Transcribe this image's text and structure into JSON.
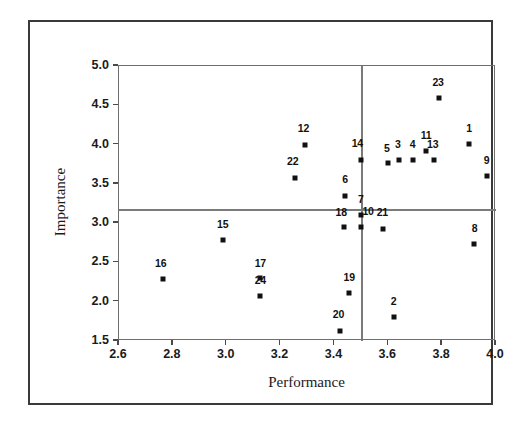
{
  "chart_data": {
    "type": "scatter",
    "title": "",
    "xlabel": "Performance",
    "ylabel": "Importance",
    "xlim": [
      2.6,
      4.0
    ],
    "ylim": [
      1.5,
      5.0
    ],
    "xticks": [
      "2.6",
      "2.8",
      "3.0",
      "3.2",
      "3.4",
      "3.6",
      "3.8",
      "4.0"
    ],
    "xtick_values": [
      2.6,
      2.8,
      3.0,
      3.2,
      3.4,
      3.6,
      3.8,
      4.0
    ],
    "yticks": [
      "1.5",
      "2.0",
      "2.5",
      "3.0",
      "3.5",
      "4.0",
      "4.5",
      "5.0"
    ],
    "ytick_values": [
      1.5,
      2.0,
      2.5,
      3.0,
      3.5,
      4.0,
      4.5,
      5.0
    ],
    "grid": false,
    "legend": "none",
    "reference_lines": {
      "vertical_x": 3.5,
      "horizontal_y": 3.18
    },
    "marker": "square",
    "marker_color": "#111111",
    "points": [
      {
        "label": "1",
        "x": 3.9,
        "y": 4.01,
        "lx": 3.9,
        "ly": 4.17
      },
      {
        "label": "2",
        "x": 3.62,
        "y": 1.81,
        "lx": 3.62,
        "ly": 1.97
      },
      {
        "label": "3",
        "x": 3.64,
        "y": 3.8,
        "lx": 3.635,
        "ly": 3.97
      },
      {
        "label": "4",
        "x": 3.69,
        "y": 3.8,
        "lx": 3.69,
        "ly": 3.97
      },
      {
        "label": "5",
        "x": 3.6,
        "y": 3.76,
        "lx": 3.595,
        "ly": 3.92
      },
      {
        "label": "6",
        "x": 3.44,
        "y": 3.35,
        "lx": 3.44,
        "ly": 3.52
      },
      {
        "label": "7",
        "x": 3.5,
        "y": 3.1,
        "lx": 3.498,
        "ly": 3.27
      },
      {
        "label": "8",
        "x": 3.92,
        "y": 2.74,
        "lx": 3.92,
        "ly": 2.9
      },
      {
        "label": "9",
        "x": 3.965,
        "y": 3.6,
        "lx": 3.965,
        "ly": 3.77
      },
      {
        "label": "10",
        "x": 3.5,
        "y": 2.95,
        "lx": 3.525,
        "ly": 3.12
      },
      {
        "label": "11",
        "x": 3.74,
        "y": 3.92,
        "lx": 3.74,
        "ly": 4.09
      },
      {
        "label": "12",
        "x": 3.29,
        "y": 4.0,
        "lx": 3.285,
        "ly": 4.17
      },
      {
        "label": "13",
        "x": 3.77,
        "y": 3.81,
        "lx": 3.765,
        "ly": 3.97
      },
      {
        "label": "14",
        "x": 3.5,
        "y": 3.81,
        "lx": 3.485,
        "ly": 3.98
      },
      {
        "label": "15",
        "x": 2.985,
        "y": 2.79,
        "lx": 2.985,
        "ly": 2.95
      },
      {
        "label": "16",
        "x": 2.765,
        "y": 2.29,
        "lx": 2.755,
        "ly": 2.45
      },
      {
        "label": "17",
        "x": 3.125,
        "y": 2.3,
        "lx": 3.125,
        "ly": 2.46
      },
      {
        "label": "18",
        "x": 3.435,
        "y": 2.95,
        "lx": 3.425,
        "ly": 3.11
      },
      {
        "label": "19",
        "x": 3.455,
        "y": 2.11,
        "lx": 3.455,
        "ly": 2.28
      },
      {
        "label": "20",
        "x": 3.42,
        "y": 1.63,
        "lx": 3.415,
        "ly": 1.8
      },
      {
        "label": "21",
        "x": 3.58,
        "y": 2.93,
        "lx": 3.578,
        "ly": 3.1
      },
      {
        "label": "22",
        "x": 3.255,
        "y": 3.58,
        "lx": 3.245,
        "ly": 3.75
      },
      {
        "label": "23",
        "x": 3.79,
        "y": 4.59,
        "lx": 3.785,
        "ly": 4.76
      },
      {
        "label": "24",
        "x": 3.125,
        "y": 2.07,
        "lx": 3.125,
        "ly": 2.24
      }
    ]
  }
}
